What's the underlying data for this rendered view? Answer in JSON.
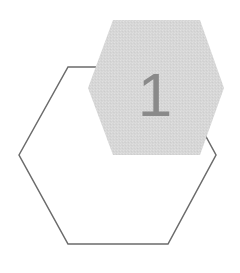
{
  "canvas": {
    "width": 240,
    "height": 273,
    "background": "#ffffff"
  },
  "diagram": {
    "name": "two-hexagon-step-graphic",
    "shapes": [
      {
        "id": "hex-outline",
        "label": "background-hexagon-outline",
        "style": "outline",
        "fill": "none",
        "stroke": "#6b6b6b",
        "stroke_width": 1.5,
        "points": "19,155 68,67 168,67 216,155 168,244 68,244",
        "z": 1
      },
      {
        "id": "hex-filled",
        "label": "foreground-hexagon-filled",
        "style": "filled",
        "fill": "#d8d8d8",
        "stroke": "none",
        "stroke_width": 0,
        "texture": "noise",
        "points": "88,88 113,20 200,20 224,88 200,155 113,155",
        "z": 2
      }
    ]
  },
  "label": {
    "text": "1",
    "color": "#8a8a8a",
    "font_size": 62,
    "x": 155,
    "y": 116
  }
}
